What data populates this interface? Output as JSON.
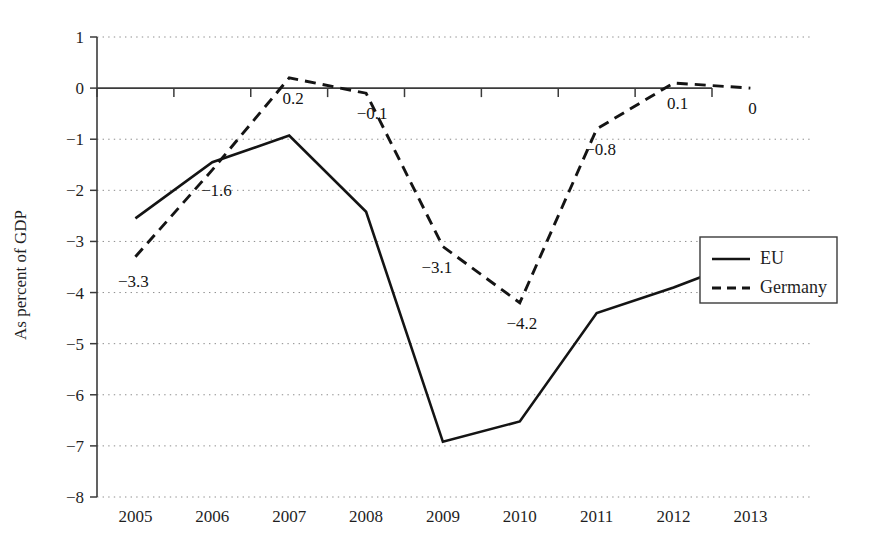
{
  "chart_data": {
    "type": "line",
    "title": "",
    "subtitle": "",
    "xlabel": "",
    "ylabel": "As percent of GDP",
    "categories": [
      "2005",
      "2006",
      "2007",
      "2008",
      "2009",
      "2010",
      "2011",
      "2012",
      "2013"
    ],
    "xlim": [
      2004.5,
      2013.5
    ],
    "ylim": [
      -8,
      1
    ],
    "yticks": [
      "1",
      "0",
      "−1",
      "−2",
      "−3",
      "−4",
      "−5",
      "−6",
      "−7",
      "−8"
    ],
    "ytick_values": [
      1,
      0,
      -1,
      -2,
      -3,
      -4,
      -5,
      -6,
      -7,
      -8
    ],
    "grid": "horizontal-dotted",
    "legend_position": "right-middle",
    "series": [
      {
        "name": "EU",
        "style": "solid",
        "color": "#141414",
        "values": [
          -2.55,
          -1.45,
          -0.93,
          -2.42,
          -6.92,
          -6.52,
          -4.4,
          -3.9,
          -3.33
        ],
        "labels": [
          "",
          "",
          "",
          "",
          "",
          "",
          "",
          "",
          ""
        ]
      },
      {
        "name": "Germany",
        "style": "dashed",
        "color": "#141414",
        "values": [
          -3.3,
          -1.6,
          0.2,
          -0.1,
          -3.1,
          -4.2,
          -0.8,
          0.1,
          0.0
        ],
        "labels": [
          "−3.3",
          "−1.6",
          "0.2",
          "−0.1",
          "−3.1",
          "−4.2",
          "−0.8",
          "0.1",
          "0"
        ]
      }
    ],
    "data_labels": [
      {
        "text": "−3.3",
        "series": "Germany",
        "category": "2005",
        "value": -3.3
      },
      {
        "text": "−1.6",
        "series": "Germany",
        "category": "2006",
        "value": -1.6
      },
      {
        "text": "0.2",
        "series": "Germany",
        "category": "2007",
        "value": 0.2
      },
      {
        "text": "−0.1",
        "series": "Germany",
        "category": "2008",
        "value": -0.1
      },
      {
        "text": "−3.1",
        "series": "Germany",
        "category": "2009",
        "value": -3.1
      },
      {
        "text": "−4.2",
        "series": "Germany",
        "category": "2010",
        "value": -4.2
      },
      {
        "text": "−0.8",
        "series": "Germany",
        "category": "2011",
        "value": -0.8
      },
      {
        "text": "0.1",
        "series": "Germany",
        "category": "2012",
        "value": 0.1
      },
      {
        "text": "0",
        "series": "Germany",
        "category": "2013",
        "value": 0.0
      }
    ],
    "legend": [
      {
        "label": "EU",
        "style": "solid"
      },
      {
        "label": "Germany",
        "style": "dashed"
      }
    ]
  }
}
